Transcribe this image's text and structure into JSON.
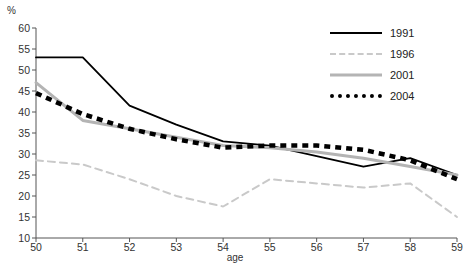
{
  "chart_data": {
    "type": "line",
    "title": "",
    "xlabel": "age",
    "ylabel": "%",
    "x": [
      50,
      51,
      52,
      53,
      54,
      55,
      56,
      57,
      58,
      59
    ],
    "xlim": [
      50,
      59
    ],
    "ylim": [
      10,
      60
    ],
    "yticks": [
      10,
      15,
      20,
      25,
      30,
      35,
      40,
      45,
      50,
      55,
      60
    ],
    "xticks": [
      50,
      51,
      52,
      53,
      54,
      55,
      56,
      57,
      58,
      59
    ],
    "grid": false,
    "legend_position": "top-right",
    "series": [
      {
        "name": "1991",
        "style": "solid",
        "color": "#000000",
        "values": [
          53.0,
          53.0,
          41.5,
          37.0,
          33.0,
          32.0,
          29.5,
          27.0,
          29.0,
          25.0
        ]
      },
      {
        "name": "1996",
        "style": "dashed",
        "color": "#c9c9c9",
        "values": [
          28.5,
          27.5,
          24.0,
          20.0,
          17.5,
          24.0,
          23.0,
          22.0,
          23.0,
          15.0
        ]
      },
      {
        "name": "2001",
        "style": "solid",
        "color": "#b4b4b4",
        "values": [
          47.0,
          38.0,
          36.0,
          34.0,
          32.0,
          31.5,
          30.5,
          29.0,
          27.0,
          25.0
        ]
      },
      {
        "name": "2004",
        "style": "dotted",
        "color": "#000000",
        "values": [
          44.5,
          39.5,
          36.0,
          33.5,
          31.5,
          32.0,
          32.0,
          31.0,
          28.5,
          24.0
        ]
      }
    ]
  },
  "axis": {
    "unit_label": "%",
    "x_axis_title": "age"
  },
  "legend": {
    "entries": [
      {
        "label": "1991"
      },
      {
        "label": "1996"
      },
      {
        "label": "2001"
      },
      {
        "label": "2004"
      }
    ]
  },
  "footnote": {
    "text": ""
  }
}
